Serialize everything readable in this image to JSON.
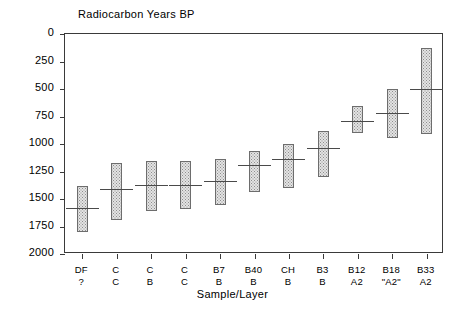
{
  "chart_data": {
    "type": "bar",
    "title": "",
    "ylabel": "Radiocarbon Years BP",
    "xlabel": "Sample/Layer",
    "ylim": [
      0,
      2000
    ],
    "y_inverted": true,
    "yticks": [
      0,
      250,
      500,
      750,
      1000,
      1250,
      1500,
      1750,
      2000
    ],
    "ytick_labels": [
      "0",
      "250",
      "500",
      "750",
      "1000",
      "1250",
      "1500",
      "1750",
      "2000"
    ],
    "grid": false,
    "legend": null,
    "categories": [
      "DF\n?",
      "C\nC",
      "C\nB",
      "C\nC",
      "B7\nB",
      "B40\nB",
      "CH\nB",
      "B3\nB",
      "B12\nA2",
      "B18\n\"A2\"",
      "B33\nA2"
    ],
    "points": [
      {
        "sample": "DF",
        "layer": "?",
        "low": 1380,
        "high": 1800,
        "value": 1580
      },
      {
        "sample": "C",
        "layer": "C",
        "low": 1175,
        "high": 1690,
        "value": 1410
      },
      {
        "sample": "C",
        "layer": "B",
        "low": 1150,
        "high": 1610,
        "value": 1375
      },
      {
        "sample": "C",
        "layer": "C",
        "low": 1150,
        "high": 1595,
        "value": 1375
      },
      {
        "sample": "B7",
        "layer": "B",
        "low": 1135,
        "high": 1555,
        "value": 1335
      },
      {
        "sample": "B40",
        "layer": "B",
        "low": 1060,
        "high": 1440,
        "value": 1195
      },
      {
        "sample": "CH",
        "layer": "B",
        "low": 1000,
        "high": 1400,
        "value": 1135
      },
      {
        "sample": "B3",
        "layer": "B",
        "low": 885,
        "high": 1300,
        "value": 1040
      },
      {
        "sample": "B12",
        "layer": "A2",
        "low": 650,
        "high": 900,
        "value": 790
      },
      {
        "sample": "B18",
        "layer": "\"A2\"",
        "low": 500,
        "high": 945,
        "value": 720
      },
      {
        "sample": "B33",
        "layer": "A2",
        "low": 125,
        "high": 910,
        "value": 500
      }
    ]
  },
  "axis": {
    "y_caption": "Radiocarbon Years BP",
    "x_caption": "Sample/Layer",
    "ytick_labels": [
      "0",
      "250",
      "500",
      "750",
      "1000",
      "1250",
      "1500",
      "1750",
      "2000"
    ],
    "xtick_samples": [
      "DF",
      "C",
      "C",
      "C",
      "B7",
      "B40",
      "CH",
      "B3",
      "B12",
      "B18",
      "B33"
    ],
    "xtick_layers": [
      "?",
      "C",
      "B",
      "C",
      "B",
      "B",
      "B",
      "B",
      "A2",
      "\"A2\"",
      "A2"
    ]
  },
  "style": {
    "bar_fill": "#e3e3e3",
    "bar_border": "#6d6d6d",
    "median_color": "#4a4a4a",
    "frame_color": "#3a3a3a",
    "background": "#ffffff"
  }
}
